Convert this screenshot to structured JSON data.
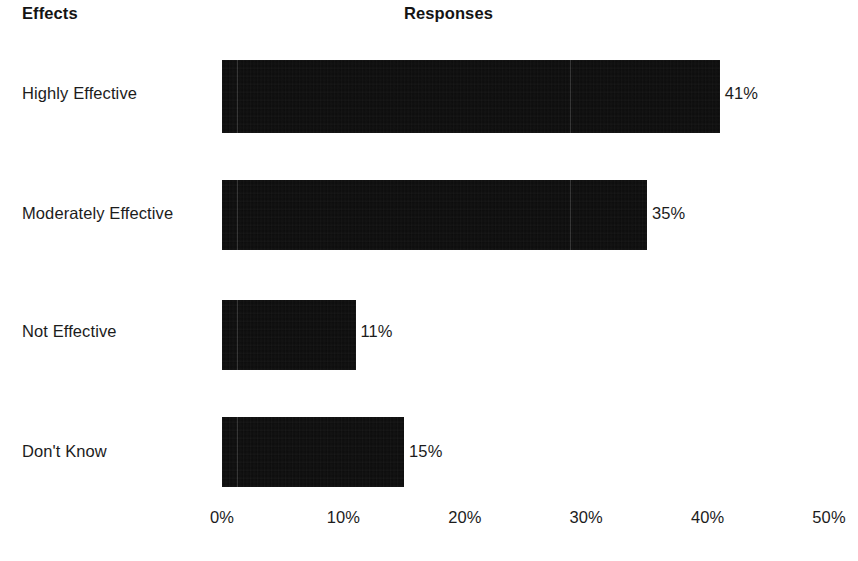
{
  "headers": {
    "category_header": "Effects",
    "value_header": "Responses"
  },
  "chart_data": {
    "type": "bar",
    "orientation": "horizontal",
    "title": "",
    "subtitle": "",
    "xlabel": "Responses",
    "ylabel": "Effects",
    "categories": [
      "Highly Effective",
      "Moderately Effective",
      "Not Effective",
      "Don't Know"
    ],
    "values": [
      41,
      35,
      11,
      15
    ],
    "value_labels": [
      "41%",
      "35%",
      "11%",
      "15%"
    ],
    "xlim": [
      0,
      50
    ],
    "xticks": [
      0,
      10,
      20,
      30,
      40,
      50
    ],
    "xtick_labels": [
      "0%",
      "10%",
      "20%",
      "30%",
      "40%",
      "50%"
    ],
    "grid": false,
    "legend": "none",
    "bar_color": "#0c0c0c",
    "background_color": "#ffffff",
    "text_color": "#1c1c1c",
    "units": "percent"
  },
  "bars": [
    {
      "label": "Highly Effective",
      "value": 41,
      "value_label": "41%",
      "top": 60,
      "height": 73,
      "label_top": 84,
      "value_label_top": 84
    },
    {
      "label": "Moderately Effective",
      "value": 35,
      "value_label": "35%",
      "top": 180,
      "height": 70,
      "label_top": 204,
      "value_label_top": 204
    },
    {
      "label": "Not Effective",
      "value": 11,
      "value_label": "11%",
      "top": 300,
      "height": 70,
      "label_top": 322,
      "value_label_top": 322
    },
    {
      "label": "Don't Know",
      "value": 15,
      "value_label": "15%",
      "top": 417,
      "height": 70,
      "label_top": 442,
      "value_label_top": 442
    }
  ],
  "axis": {
    "origin_x": 222,
    "px_per_percent": 12.14,
    "ticks": [
      {
        "label": "0%",
        "value": 0
      },
      {
        "label": "10%",
        "value": 10
      },
      {
        "label": "20%",
        "value": 20
      },
      {
        "label": "30%",
        "value": 30
      },
      {
        "label": "40%",
        "value": 40
      },
      {
        "label": "50%",
        "value": 50
      }
    ]
  }
}
